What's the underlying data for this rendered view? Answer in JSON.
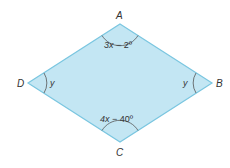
{
  "figure": {
    "shape": "rhombus",
    "fill_color": "#c3e6f3",
    "stroke_color": "#7ac6e0",
    "arc_color": "#555555",
    "vertices": {
      "A": {
        "label": "A",
        "x": 120,
        "y": 24
      },
      "B": {
        "label": "B",
        "x": 212,
        "y": 83
      },
      "C": {
        "label": "C",
        "x": 120,
        "y": 142
      },
      "D": {
        "label": "D",
        "x": 28,
        "y": 83
      }
    },
    "angles": {
      "A": {
        "var": "3x",
        "rest": " − 2º"
      },
      "C": {
        "var": "4x",
        "rest": " − 40º"
      },
      "B": {
        "var": "y"
      },
      "D": {
        "var": "y"
      }
    }
  }
}
